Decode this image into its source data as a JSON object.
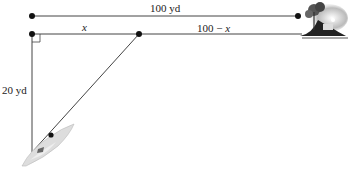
{
  "diagram": {
    "type": "geometry-word-problem",
    "labels": {
      "total_distance": "100 yd",
      "segment_x": "x",
      "segment_remaining": "100 − x",
      "vertical_distance": "20 yd"
    },
    "points": {
      "top_left": [
        32,
        16
      ],
      "top_right": [
        298,
        16
      ],
      "corner": [
        32,
        34
      ],
      "landing": [
        139,
        34
      ],
      "boat": [
        32,
        150
      ]
    },
    "icons": [
      "island-house-icon",
      "boat-icon",
      "right-angle-marker"
    ],
    "colors": {
      "line": "#3a3a3a",
      "dot": "#111111",
      "text": "#222222"
    }
  }
}
